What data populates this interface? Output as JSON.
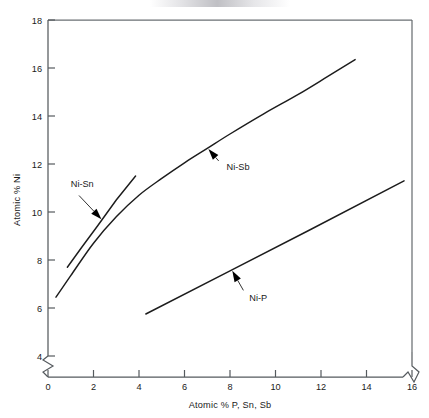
{
  "figure": {
    "background_color": "#ffffff",
    "line_color": "#1c1c1c",
    "axis_color": "#555a5e"
  },
  "chart_data": {
    "type": "line",
    "title": "",
    "subtitle": "",
    "xlabel": "Atomic % P, Sn, Sb",
    "ylabel": "Atomic % Ni",
    "xlim": [
      0,
      16
    ],
    "ylim": [
      4,
      18
    ],
    "y_axis_break_below": 4,
    "x_axis_break_after": 16,
    "grid": false,
    "legend_position": "inline-annotations",
    "xticks": [
      0,
      2,
      4,
      6,
      8,
      10,
      12,
      14,
      16
    ],
    "xticklabels": [
      "0",
      "2",
      "4",
      "6",
      "8",
      "10",
      "12",
      "14",
      "16"
    ],
    "yticks": [
      4,
      6,
      8,
      10,
      12,
      14,
      16,
      18
    ],
    "yticklabels": [
      "4",
      "6",
      "8",
      "10",
      "12",
      "14",
      "16",
      "18"
    ],
    "series": [
      {
        "name": "Ni-Sn",
        "label": "Ni-Sn",
        "shape": "straight",
        "x": [
          0.85,
          1.5,
          2.2,
          3.0,
          3.85
        ],
        "y": [
          7.7,
          8.55,
          9.45,
          10.5,
          11.5
        ]
      },
      {
        "name": "Ni-Sb",
        "label": "Ni-Sb",
        "shape": "curved",
        "x": [
          0.35,
          1.0,
          2.0,
          3.0,
          4.0,
          5.0,
          6.0,
          7.0,
          8.0,
          9.5,
          11.0,
          12.3,
          13.5
        ],
        "y": [
          6.45,
          7.35,
          8.7,
          9.8,
          10.7,
          11.4,
          12.05,
          12.65,
          13.25,
          14.1,
          14.9,
          15.65,
          16.35
        ]
      },
      {
        "name": "Ni-P",
        "label": "Ni-P",
        "shape": "straight",
        "x": [
          4.3,
          8.0,
          11.5,
          15.65
        ],
        "y": [
          5.75,
          7.55,
          9.25,
          11.3
        ]
      }
    ],
    "annotations": [
      {
        "name": "Ni-Sn",
        "text": "Ni-Sn",
        "text_x": 1.0,
        "text_y": 11.05,
        "points_to_x": 2.35,
        "points_to_y": 9.7
      },
      {
        "name": "Ni-Sb",
        "text": "Ni-Sb",
        "text_x": 7.85,
        "text_y": 11.75,
        "points_to_x": 7.05,
        "points_to_y": 12.62
      },
      {
        "name": "Ni-P",
        "text": "Ni-P",
        "text_x": 8.85,
        "text_y": 6.3,
        "points_to_x": 8.1,
        "points_to_y": 7.55
      }
    ]
  }
}
